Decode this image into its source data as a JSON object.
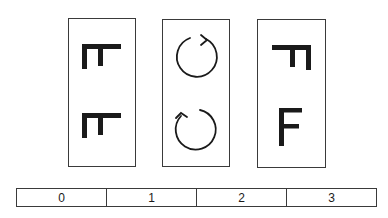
{
  "figure": {
    "stroke_color": "#1a1a1a",
    "border_color": "#3a3a3a",
    "panels": [
      {
        "id": "panel-0",
        "content": "rotated-F-glyphs",
        "glyphs": [
          {
            "name": "rotated-f-glyph",
            "orientation": "rotated-90-ccw"
          },
          {
            "name": "rotated-f-glyph",
            "orientation": "rotated-90-ccw"
          }
        ]
      },
      {
        "id": "panel-1",
        "content": "rotation-arrows",
        "glyphs": [
          {
            "name": "clockwise-arrow",
            "direction": "clockwise"
          },
          {
            "name": "counterclockwise-arrow",
            "direction": "counterclockwise"
          }
        ]
      },
      {
        "id": "panel-2",
        "content": "F-glyphs",
        "glyphs": [
          {
            "name": "rotated-f-glyph",
            "orientation": "rotated-90-cw-mirrored"
          },
          {
            "name": "upright-f-glyph",
            "orientation": "upright",
            "text": "F"
          }
        ]
      }
    ]
  },
  "scale": {
    "labels": [
      "0",
      "1",
      "2",
      "3"
    ]
  }
}
